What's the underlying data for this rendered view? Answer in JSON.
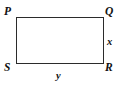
{
  "figure": {
    "kind": "geometry-diagram",
    "shape": "rectangle",
    "stroke_color": "#2b2b2b",
    "text_color": "#111111",
    "background_color": "#ffffff",
    "vertices": [
      {
        "id": "P",
        "label": "P",
        "position": "top-left"
      },
      {
        "id": "Q",
        "label": "Q",
        "position": "top-right"
      },
      {
        "id": "R",
        "label": "R",
        "position": "bottom-right"
      },
      {
        "id": "S",
        "label": "S",
        "position": "bottom-left"
      }
    ],
    "side_labels": [
      {
        "id": "x",
        "label": "x",
        "side": "right",
        "orientation": "vertical"
      },
      {
        "id": "y",
        "label": "y",
        "side": "bottom",
        "orientation": "horizontal"
      }
    ]
  }
}
